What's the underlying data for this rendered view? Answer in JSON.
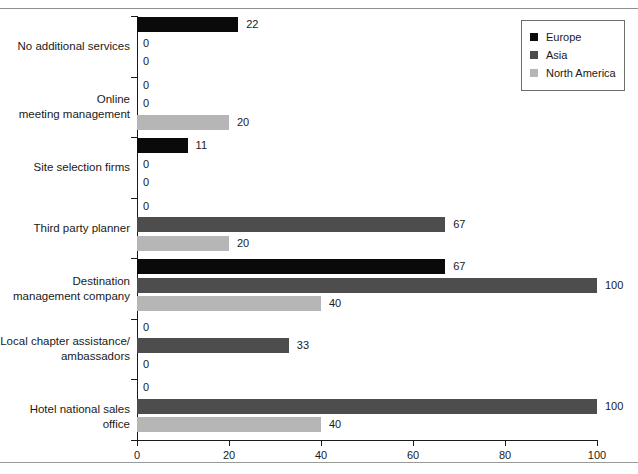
{
  "chart_data": {
    "type": "bar",
    "orientation": "horizontal",
    "title": "",
    "xlabel": "",
    "ylabel": "",
    "xlim": [
      0,
      100
    ],
    "xticks": [
      0,
      20,
      40,
      60,
      80,
      100
    ],
    "grid": false,
    "legend_position": "top-right",
    "categories": [
      "No additional services",
      "Online\nmeeting management",
      "Site selection firms",
      "Third party planner",
      "Destination\nmanagement company",
      "Local chapter assistance/\nambassadors",
      "Hotel national sales office"
    ],
    "series": [
      {
        "name": "Europe",
        "color": "#0a0a0a",
        "values": [
          22,
          0,
          11,
          0,
          67,
          0,
          0
        ]
      },
      {
        "name": "Asia",
        "color": "#4d4d4d",
        "values": [
          0,
          0,
          0,
          67,
          100,
          33,
          100
        ]
      },
      {
        "name": "North America",
        "color": "#b6b6b6",
        "values": [
          0,
          20,
          0,
          20,
          40,
          0,
          40
        ]
      }
    ],
    "bar_labels": [
      [
        "22",
        "0",
        "0"
      ],
      [
        "0",
        "0",
        "20"
      ],
      [
        "11",
        "0",
        "0"
      ],
      [
        "0",
        "67",
        "20"
      ],
      [
        "67",
        "100",
        "40"
      ],
      [
        "0",
        "33",
        "0"
      ],
      [
        "0",
        "100",
        "40"
      ]
    ]
  },
  "legend": {
    "items": [
      {
        "label": "Europe",
        "swatch": "europe"
      },
      {
        "label": "Asia",
        "swatch": "asia"
      },
      {
        "label": "North America",
        "swatch": "north-america"
      }
    ]
  },
  "axis": {
    "x_tick_labels": [
      "0",
      "20",
      "40",
      "60",
      "80",
      "100"
    ]
  }
}
